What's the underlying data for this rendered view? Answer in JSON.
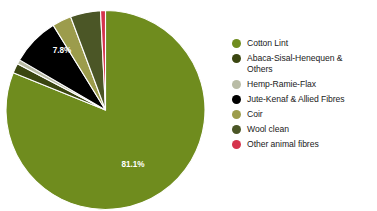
{
  "chart_data": {
    "type": "pie",
    "title": "",
    "subtitle": "",
    "xlabel": "",
    "ylabel": "",
    "legend_position": "right",
    "grid": false,
    "units": "percent",
    "categories": [
      "Cotton Lint",
      "Abaca-Sisal-Henequen & Others",
      "Hemp-Ramie-Flax",
      "Jute-Kenaf & Allied Fibres",
      "Coir",
      "Wool clean",
      "Other animal fibres"
    ],
    "values": [
      81.1,
      1.6,
      0.7,
      7.8,
      3.1,
      4.9,
      0.8
    ],
    "colors": [
      "#6f8c1e",
      "#3b4611",
      "#b9bca6",
      "#000000",
      "#9c9c4c",
      "#4b5626",
      "#d5344d"
    ],
    "data_labels": [
      {
        "category": "Cotton Lint",
        "text": "81.1%",
        "shown": true
      },
      {
        "category": "Abaca-Sisal-Henequen & Others",
        "text": "1.6%",
        "shown": false
      },
      {
        "category": "Hemp-Ramie-Flax",
        "text": "0.7%",
        "shown": false
      },
      {
        "category": "Jute-Kenaf & Allied Fibres",
        "text": "7.8%",
        "shown": true
      },
      {
        "category": "Coir",
        "text": "3.1%",
        "shown": false
      },
      {
        "category": "Wool clean",
        "text": "4.9%",
        "shown": false
      },
      {
        "category": "Other animal fibres",
        "text": "0.8%",
        "shown": false
      }
    ],
    "visible_labels": {
      "cotton": "81.1%",
      "jute": "7.8%"
    }
  },
  "legend": {
    "items": [
      {
        "label": "Cotton Lint",
        "color": "#6f8c1e"
      },
      {
        "label": "Abaca-Sisal-Henequen &\nOthers",
        "color": "#3b4611"
      },
      {
        "label": "Hemp-Ramie-Flax",
        "color": "#b9bca6"
      },
      {
        "label": "Jute-Kenaf & Allied Fibres",
        "color": "#000000"
      },
      {
        "label": "Coir",
        "color": "#9c9c4c"
      },
      {
        "label": "Wool clean",
        "color": "#4b5626"
      },
      {
        "label": "Other animal fibres",
        "color": "#d5344d"
      }
    ]
  }
}
